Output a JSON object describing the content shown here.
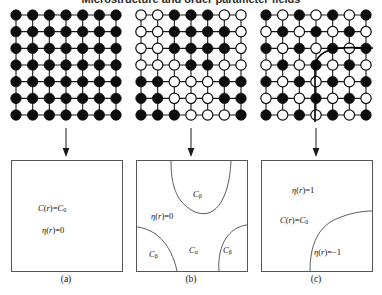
{
  "figure": {
    "title_clipped": "Microstructure and order parameter fields",
    "panel_count": 3
  },
  "panels": [
    {
      "id": "a",
      "caption": "(a)",
      "lattice": {
        "rows": 7,
        "cols": 7,
        "description": "disordered solid solution, all sites occupied",
        "fill_matrix": [
          [
            1,
            1,
            1,
            1,
            1,
            1,
            1
          ],
          [
            1,
            1,
            1,
            1,
            1,
            1,
            1
          ],
          [
            1,
            1,
            1,
            1,
            1,
            1,
            1
          ],
          [
            1,
            1,
            1,
            1,
            1,
            1,
            1
          ],
          [
            1,
            1,
            1,
            1,
            1,
            1,
            1
          ],
          [
            1,
            1,
            1,
            1,
            1,
            1,
            1
          ],
          [
            1,
            1,
            1,
            1,
            1,
            1,
            1
          ]
        ]
      },
      "map_labels": [
        {
          "text": "C(r)=C0",
          "html": "<i>C</i>(<i>r</i>)=<i>C</i><span class='sub'>0</span>",
          "x": 26,
          "y": 42
        },
        {
          "text": "η(r)=0",
          "html": "<i>η</i>(<i>r</i>)=0",
          "x": 30,
          "y": 64
        }
      ],
      "curves": []
    },
    {
      "id": "b",
      "caption": "(b)",
      "lattice": {
        "rows": 7,
        "cols": 7,
        "description": "two-phase mixture of alpha and beta domains",
        "fill_matrix": [
          [
            0,
            0,
            1,
            1,
            1,
            0,
            0
          ],
          [
            0,
            0,
            1,
            1,
            1,
            1,
            0
          ],
          [
            0,
            0,
            1,
            1,
            1,
            1,
            0
          ],
          [
            0,
            0,
            0,
            1,
            1,
            0,
            0
          ],
          [
            1,
            1,
            0,
            0,
            0,
            1,
            1
          ],
          [
            1,
            1,
            0,
            0,
            0,
            1,
            1
          ],
          [
            1,
            1,
            1,
            0,
            0,
            0,
            1
          ]
        ]
      },
      "map_labels": [
        {
          "text": "Cβ",
          "html": "<i>C</i><span class='sub'>β</span>",
          "x": 56,
          "y": 28
        },
        {
          "text": "η(r)=0",
          "html": "<i>η</i>(<i>r</i>)=0",
          "x": 14,
          "y": 50
        },
        {
          "text": "Cβ",
          "html": "<i>C</i><span class='sub'>β</span>",
          "x": 12,
          "y": 88
        },
        {
          "text": "Cα",
          "html": "<i>C</i><span class='sub'>α</span>",
          "x": 52,
          "y": 84
        },
        {
          "text": "Cβ",
          "html": "<i>C</i><span class='sub'>β</span>",
          "x": 86,
          "y": 84
        }
      ],
      "curves": [
        "M 34 0 C 34 22 38 40 56 50 C 76 60 92 42 94 0",
        "M 0 66 C 18 68 34 82 40 110",
        "M 110 64 C 92 66 80 84 82 110"
      ]
    },
    {
      "id": "c",
      "caption": "(c)",
      "lattice": {
        "rows": 7,
        "cols": 7,
        "description": "ordered checkerboard phase with antiphase boundary",
        "fill_matrix": [
          [
            1,
            0,
            1,
            0,
            1,
            0,
            1
          ],
          [
            0,
            1,
            0,
            1,
            0,
            1,
            0
          ],
          [
            1,
            0,
            1,
            0,
            1,
            0,
            1
          ],
          [
            0,
            1,
            0,
            1,
            0,
            1,
            0
          ],
          [
            1,
            0,
            1,
            0,
            1,
            0,
            1
          ],
          [
            0,
            1,
            0,
            1,
            0,
            1,
            0
          ],
          [
            1,
            0,
            1,
            0,
            1,
            0,
            1
          ]
        ],
        "boundary_curve": "M 56 114 L 56 60 C 56 48 66 42 80 40 C 92 39 104 40 114 40"
      },
      "map_labels": [
        {
          "text": "η(r)=1",
          "html": "<i>η</i>(<i>r</i>)=1",
          "x": 30,
          "y": 24
        },
        {
          "text": "C(r)=C0",
          "html": "<i>C</i>(<i>r</i>)=<i>C</i><span class='sub'>0</span>",
          "x": 18,
          "y": 54
        },
        {
          "text": "η(r)=−1",
          "html": "<i>η</i>(<i>r</i>)=−1",
          "x": 52,
          "y": 86
        }
      ],
      "curves": [
        "M 48 110 C 48 84 56 66 74 58 C 88 52 100 50 110 50"
      ]
    }
  ],
  "style": {
    "filled_circle_color": "#0d0d0d",
    "open_circle_fill": "#ffffff",
    "line_color": "#1a1a1a",
    "box_border_color": "#555555",
    "curve_color": "#4a4a4a",
    "background": "#ffffff"
  },
  "arrow": {
    "name": "down-arrow",
    "direction": "down"
  }
}
